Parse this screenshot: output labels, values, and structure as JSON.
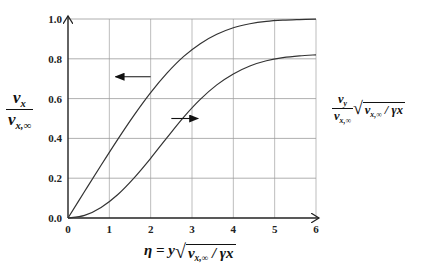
{
  "chart_data": {
    "type": "line",
    "title": "",
    "xlabel": "η = y √(v_x,∞ / γx)",
    "ylabel_left": "v_x / v_x,∞",
    "ylabel_right": "(v_y / v_x,∞) √(v_x,∞ / γx)",
    "xlim": [
      0,
      6
    ],
    "ylim": [
      0,
      1.0
    ],
    "x_ticks": [
      "0",
      "1",
      "2",
      "3",
      "4",
      "5",
      "6"
    ],
    "y_ticks": [
      "0.0",
      "0.2",
      "0.4",
      "0.6",
      "0.8",
      "1.0"
    ],
    "grid": true,
    "legend": "none (arrows indicate which axis each curve belongs to)",
    "series": [
      {
        "name": "v_x / v_x,∞",
        "axis": "left",
        "x": [
          0,
          0.4,
          0.8,
          1.2,
          1.6,
          2.0,
          2.4,
          2.8,
          3.2,
          3.6,
          4.0,
          4.4,
          4.8,
          5.2,
          5.6,
          6.0
        ],
        "values": [
          0,
          0.133,
          0.265,
          0.394,
          0.517,
          0.63,
          0.729,
          0.812,
          0.876,
          0.923,
          0.956,
          0.976,
          0.988,
          0.994,
          0.997,
          0.999
        ]
      },
      {
        "name": "(v_y / v_x,∞) √(v_x,∞ / γx)",
        "axis": "right",
        "x": [
          0,
          0.4,
          0.8,
          1.2,
          1.6,
          2.0,
          2.4,
          2.8,
          3.2,
          3.6,
          4.0,
          4.4,
          4.8,
          5.2,
          5.6,
          6.0
        ],
        "values": [
          0,
          0.013,
          0.053,
          0.117,
          0.202,
          0.3,
          0.405,
          0.507,
          0.596,
          0.669,
          0.724,
          0.764,
          0.79,
          0.806,
          0.815,
          0.82
        ]
      }
    ],
    "annotations": [
      {
        "type": "arrow",
        "direction": "left",
        "points_to": "left axis",
        "from": [
          2.0,
          0.71
        ],
        "to": [
          1.15,
          0.71
        ]
      },
      {
        "type": "arrow",
        "direction": "right",
        "points_to": "right axis",
        "from": [
          2.5,
          0.5
        ],
        "to": [
          3.15,
          0.5
        ]
      }
    ]
  },
  "labels": {
    "y_left": {
      "num": "v",
      "num_sub": "x",
      "den": "v",
      "den_sub": "x,∞"
    },
    "y_right": {
      "num": "v",
      "num_sub": "y",
      "den": "v",
      "den_sub": "x,∞",
      "rad_pre": "v",
      "rad_sub": "x,∞",
      "rad_post": "/ γx"
    },
    "x_axis": {
      "pre": "η = y",
      "rad_pre": "v",
      "rad_sub": "x,∞",
      "rad_post": "/ γx"
    }
  }
}
